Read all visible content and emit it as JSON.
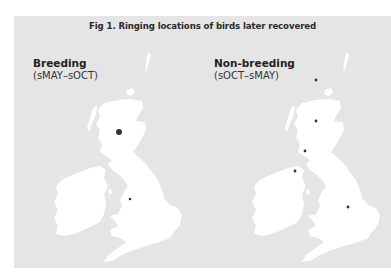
{
  "figure": {
    "title": "Fig 1. Ringing locations of birds later recovered",
    "background_color": "#e5e5e5",
    "land_color": "#ffffff",
    "dot_color": "#333333"
  },
  "panels": [
    {
      "heading": "Breeding",
      "period": "(sMAY–sOCT)",
      "points": [
        {
          "x": 119,
          "y": 132,
          "r": 3.0,
          "label": "large"
        },
        {
          "x": 130,
          "y": 199,
          "r": 1.3,
          "label": "small"
        }
      ]
    },
    {
      "heading": "Non-breeding",
      "period": "(sOCT–sMAY)",
      "points": [
        {
          "x": 316,
          "y": 80,
          "r": 1.4
        },
        {
          "x": 316,
          "y": 121,
          "r": 1.4
        },
        {
          "x": 305,
          "y": 151,
          "r": 1.4
        },
        {
          "x": 295,
          "y": 171,
          "r": 1.4
        },
        {
          "x": 348,
          "y": 207,
          "r": 1.4
        }
      ]
    }
  ]
}
